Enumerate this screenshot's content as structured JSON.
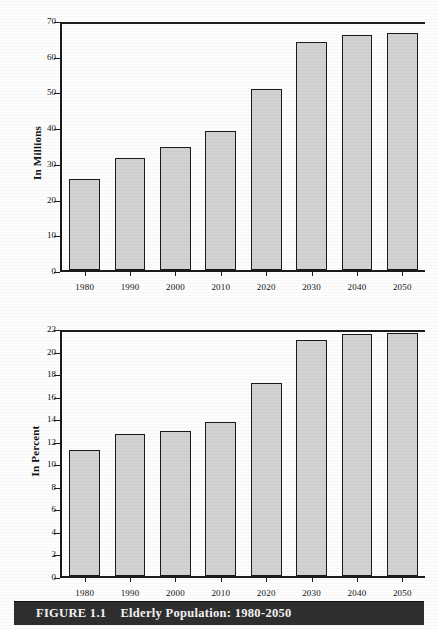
{
  "caption": {
    "figure_number": "FIGURE 1.1",
    "title": "Elderly Population: 1980-2050"
  },
  "colors": {
    "bar_fill": "#d2d2d2",
    "bar_border": "#1b1b1b",
    "axis": "#1b1b1b",
    "caption_band": "#2e2e2e",
    "caption_text": "#f4f4f4",
    "page_background": "#fdfdfd"
  },
  "chart_data": [
    {
      "type": "bar",
      "title": "",
      "xlabel": "",
      "ylabel": "In Millions",
      "categories": [
        "1980",
        "1990",
        "2000",
        "2010",
        "2020",
        "2030",
        "2040",
        "2050"
      ],
      "values": [
        25.7,
        31.6,
        34.8,
        39.2,
        51.2,
        64.3,
        66.3,
        67.0
      ],
      "ylim": [
        0,
        70
      ],
      "ytick_values": [
        0,
        10,
        20,
        30,
        40,
        50,
        60,
        70
      ],
      "ytick_labels": [
        "0",
        "10",
        "20",
        "30",
        "40",
        "50",
        "60",
        "70"
      ],
      "grid": false,
      "legend": "none"
    },
    {
      "type": "bar",
      "title": "",
      "xlabel": "",
      "ylabel": "In Percent",
      "categories": [
        "1980",
        "1990",
        "2000",
        "2010",
        "2020",
        "2030",
        "2040",
        "2050"
      ],
      "values": [
        11.3,
        12.7,
        13.0,
        13.8,
        17.3,
        21.1,
        21.6,
        21.7
      ],
      "ylim": [
        0,
        22
      ],
      "ytick_values": [
        0,
        2,
        4,
        6,
        8,
        10,
        12,
        14,
        16,
        18,
        20,
        22
      ],
      "ytick_labels": [
        "0",
        "2",
        "4",
        "6",
        "8",
        "10",
        "12",
        "14",
        "16",
        "18",
        "20",
        "22"
      ],
      "grid": false,
      "legend": "none"
    }
  ]
}
